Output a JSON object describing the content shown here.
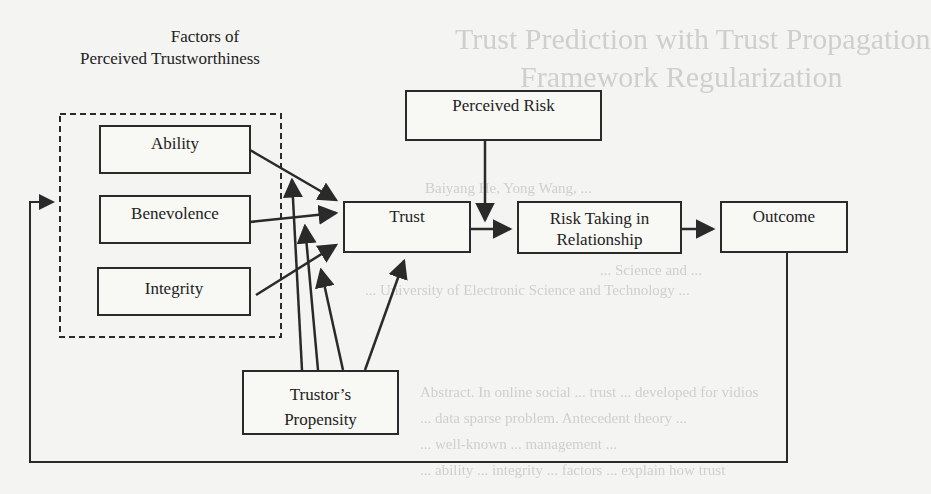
{
  "background_ghost_text": {
    "title_line_1": "Trust Prediction with Trust Propagation",
    "title_line_2": "Framework Regularization",
    "authors": "Baiyang He, Yong Wang, ...",
    "affiliation_1": "... Science and ...",
    "affiliation_2": "... University of Electronic Science and Technology ...",
    "abstract_1": "Abstract. In online social ... trust ... developed for vidios",
    "abstract_2": "... data sparse problem. Antecedent theory ...",
    "abstract_3": "... well-known ... management ...",
    "abstract_4": "... ability ... integrity ... factors ... explain how trust"
  },
  "diagram": {
    "group_title_line_1": "Factors of",
    "group_title_line_2": "Perceived Trustworthiness",
    "nodes": {
      "ability": "Ability",
      "benevolence": "Benevolence",
      "integrity": "Integrity",
      "perceived_risk": "Perceived Risk",
      "trust": "Trust",
      "risk_taking_line_1": "Risk Taking in",
      "risk_taking_line_2": "Relationship",
      "outcome": "Outcome",
      "propensity_line_1": "Trustor’s",
      "propensity_line_2": "Propensity"
    },
    "edges": [
      {
        "from": "Ability",
        "to": "Trust"
      },
      {
        "from": "Benevolence",
        "to": "Trust"
      },
      {
        "from": "Integrity",
        "to": "Trust"
      },
      {
        "from": "Trustor’s Propensity",
        "to": "Ability"
      },
      {
        "from": "Trustor’s Propensity",
        "to": "Benevolence"
      },
      {
        "from": "Trustor’s Propensity",
        "to": "Integrity"
      },
      {
        "from": "Trustor’s Propensity",
        "to": "Trust"
      },
      {
        "from": "Trust",
        "to": "Risk Taking in Relationship"
      },
      {
        "from": "Perceived Risk",
        "to": "Risk Taking in Relationship"
      },
      {
        "from": "Risk Taking in Relationship",
        "to": "Outcome"
      },
      {
        "from": "Outcome",
        "to": "Factors of Perceived Trustworthiness"
      }
    ],
    "colors": {
      "line": "#2a2a2a",
      "background": "#f4f4f2"
    }
  }
}
